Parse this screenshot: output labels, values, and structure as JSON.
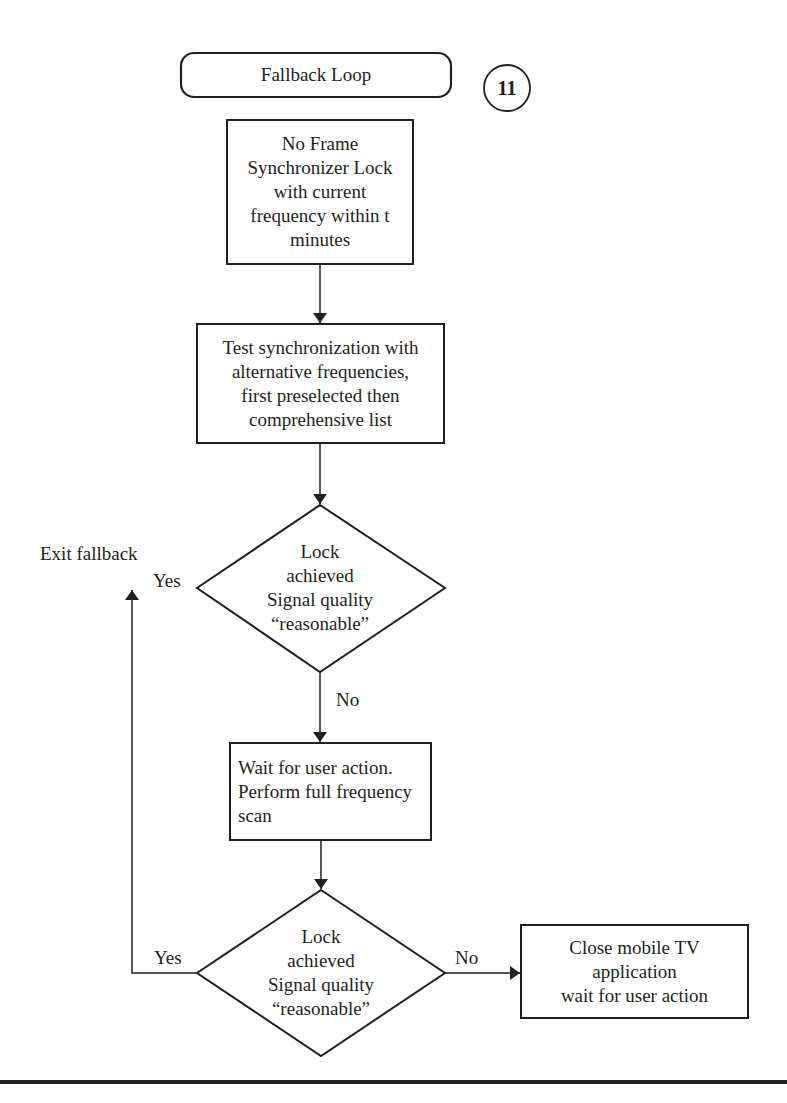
{
  "diagram": {
    "type": "flowchart",
    "start": {
      "label": "Fallback Loop"
    },
    "badge": {
      "label": "11"
    },
    "nodes": {
      "no_lock": {
        "lines": [
          "No Frame",
          "Synchronizer Lock",
          "with current",
          "frequency within t",
          "minutes"
        ]
      },
      "test_sync": {
        "lines": [
          "Test synchronization with",
          "alternative frequencies,",
          "first preselected then",
          "comprehensive list"
        ]
      },
      "decision1": {
        "lines": [
          "Lock",
          "achieved",
          "Signal quality",
          "“reasonable”"
        ]
      },
      "wait_scan": {
        "lines": [
          "Wait for user action.",
          "Perform full frequency",
          "scan"
        ]
      },
      "decision2": {
        "lines": [
          "Lock",
          "achieved",
          "Signal quality",
          "“reasonable”"
        ]
      },
      "close_app": {
        "lines": [
          "Close mobile TV",
          "application",
          "wait for user action"
        ]
      }
    },
    "edge_labels": {
      "d1_yes": "Yes",
      "d1_no": "No",
      "d2_yes": "Yes",
      "d2_no": "No",
      "exit": "Exit fallback"
    },
    "colors": {
      "stroke": "#231f20",
      "background": "#ffffff"
    }
  }
}
